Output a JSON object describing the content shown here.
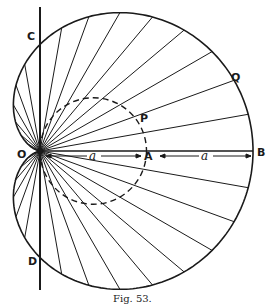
{
  "figure": {
    "caption": "Fig. 53.",
    "curve": "cardioid",
    "labels": {
      "C": "C",
      "Q": "Q",
      "P": "P",
      "O": "O",
      "A": "A",
      "B": "B",
      "D": "D",
      "a1": "a",
      "a2": "a"
    },
    "geometry": {
      "pole": [
        40,
        151
      ],
      "a": 106.5,
      "ray_count": 36,
      "ink_color": "#1a1a1a"
    }
  }
}
